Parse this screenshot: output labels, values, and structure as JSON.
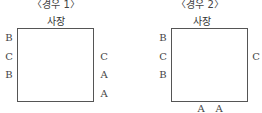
{
  "cases": [
    {
      "title": "〈경우 1〉",
      "head": "사장",
      "left": [
        "B",
        "C",
        "B"
      ],
      "right": [
        "C",
        "A",
        "A"
      ],
      "bottom": []
    },
    {
      "title": "〈경우 2〉",
      "head": "사장",
      "left": [
        "B",
        "C",
        "B"
      ],
      "right": [
        "C"
      ],
      "bottom": [
        "A",
        "A"
      ]
    }
  ]
}
